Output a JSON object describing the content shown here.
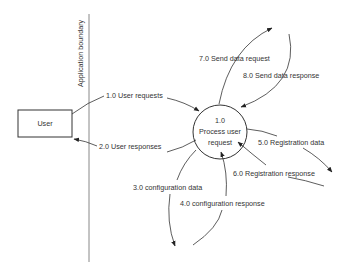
{
  "diagram": {
    "type": "data-flow-diagram",
    "boundary": {
      "label": "Application boundary"
    },
    "external_entity": {
      "label": "User"
    },
    "process": {
      "id": "1.0",
      "line1": "Process user",
      "line2": "request"
    },
    "flows": [
      {
        "id": "1.0",
        "label": "1.0 User requests",
        "from": "User",
        "to": "1.0 Process user request"
      },
      {
        "id": "2.0",
        "label": "2.0 User responses",
        "from": "1.0 Process user request",
        "to": "User"
      },
      {
        "id": "3.0",
        "label": "3.0 configuration data",
        "from": "1.0 Process user request",
        "to": "(external)"
      },
      {
        "id": "4.0",
        "label": "4.0 configuration response",
        "from": "(external)",
        "to": "1.0 Process user request"
      },
      {
        "id": "5.0",
        "label": "5.0 Registration data",
        "from": "1.0 Process user request",
        "to": "(external)"
      },
      {
        "id": "6.0",
        "label": "6.0 Registration response",
        "from": "(external)",
        "to": "1.0 Process user request"
      },
      {
        "id": "7.0",
        "label": "7.0 Send data request",
        "from": "1.0 Process user request",
        "to": "(external)"
      },
      {
        "id": "8.0",
        "label": "8.0 Send data response",
        "from": "(external)",
        "to": "1.0 Process user request"
      }
    ],
    "colors": {
      "stroke": "#333333",
      "boundary": "#888888",
      "background": "#ffffff"
    }
  }
}
